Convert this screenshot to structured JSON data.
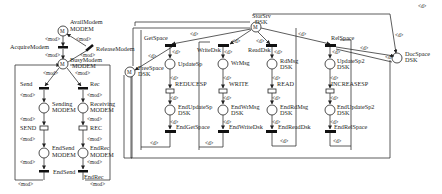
{
  "modem_net": {
    "places": {
      "avail": {
        "name": "AvailModem",
        "type": "MODEM",
        "token": "M"
      },
      "busy": {
        "name": "BusyModem",
        "type": "MODEM",
        "token": "M"
      },
      "sending": {
        "name": "Sending",
        "type": "MODEM"
      },
      "receiving": {
        "name": "Receiving",
        "type": "MODEM"
      },
      "end_send": {
        "name": "EndSend",
        "type": "MODEM"
      },
      "end_rec": {
        "name": "EndRec",
        "type": "MODEM"
      }
    },
    "transitions": {
      "acquire": "AcquireModem",
      "release": "ReleaseModem",
      "send": "Send",
      "rec": "Rec",
      "send_op": "SEND",
      "rec_op": "REC",
      "end_send": "EndSend",
      "end_rec": "EndRec"
    },
    "arc_label": "<mod>"
  },
  "dsk_net": {
    "places": {
      "store_srv": {
        "name": "StorSrv",
        "type": "DSK",
        "token": "M"
      },
      "free_space": {
        "name": "FreeSpace",
        "type": "DSK",
        "token": "M"
      },
      "doc_space": {
        "name": "DocSpace",
        "type": "DSK"
      },
      "update_sp": {
        "name": "UpdateSp",
        "type": ""
      },
      "end_update_sp": {
        "name": "EndUpdateSp",
        "type": "DSK"
      },
      "wr_msg": {
        "name": "WrMsg",
        "type": ""
      },
      "end_wr_msg": {
        "name": "EndWrMsg",
        "type": "DSK"
      },
      "rd_msg": {
        "name": "RdMsg",
        "type": "DSK"
      },
      "end_rd_msg": {
        "name": "EndRdMsg",
        "type": "DSK"
      },
      "update_sp2": {
        "name": "UpdateSp2",
        "type": "DSK"
      },
      "end_update_sp2": {
        "name": "EndUpdateSp2",
        "type": "DSK"
      }
    },
    "transitions": {
      "get_space": "GetSpace",
      "write_dsk": "WriteDsk",
      "read_dsk": "ReadDsk",
      "rel_space": "RelSpace",
      "reduce": "REDUCESP",
      "write": "WRITE",
      "read": "READ",
      "increase": "INCREASESP",
      "end_get_space": "EndGetSpace",
      "end_write_dsk": "EndWriteDsk",
      "end_read_dsk": "EndReadDsk",
      "end_rel_space": "EndRelSpace"
    },
    "arc_label": "<d>"
  }
}
